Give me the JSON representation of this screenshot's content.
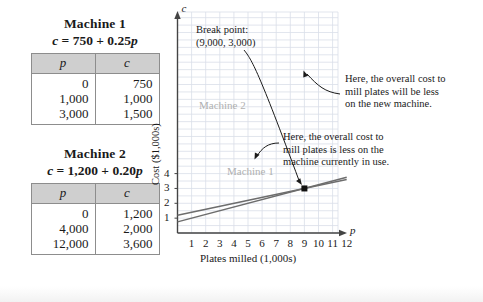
{
  "tables": [
    {
      "name": "machine-1",
      "title": "Machine 1",
      "formula_prefix": "c",
      "formula_body": " = 750 + 0.25",
      "formula_var": "p",
      "headers": [
        "p",
        "c"
      ],
      "rows": [
        [
          "0",
          "750"
        ],
        [
          "1,000",
          "1,000"
        ],
        [
          "3,000",
          "1,500"
        ]
      ]
    },
    {
      "name": "machine-2",
      "title": "Machine 2",
      "formula_prefix": "c",
      "formula_body": " = 1,200 + 0.20",
      "formula_var": "p",
      "headers": [
        "p",
        "c"
      ],
      "rows": [
        [
          "0",
          "1,200"
        ],
        [
          "4,000",
          "2,000"
        ],
        [
          "12,000",
          "3,600"
        ]
      ]
    }
  ],
  "chart_data": {
    "type": "line",
    "title": "",
    "xlabel": "Plates milled (1,000s)",
    "ylabel": "Cost ($1,000s)",
    "x_axis_symbol": "p",
    "y_axis_symbol": "c",
    "xlim": [
      0,
      12
    ],
    "ylim": [
      0,
      4.2
    ],
    "xticks": [
      "1",
      "2",
      "3",
      "4",
      "5",
      "6",
      "7",
      "8",
      "9",
      "10",
      "11",
      "12"
    ],
    "xtick_values": [
      1,
      2,
      3,
      4,
      5,
      6,
      7,
      8,
      9,
      10,
      11,
      12
    ],
    "yticks": [
      "1",
      "2",
      "3",
      "4"
    ],
    "ytick_values": [
      1,
      2,
      3,
      4
    ],
    "grid": true,
    "grid_color": "#d9dee8",
    "legend_position": "inline",
    "series": [
      {
        "name": "Machine 1",
        "label": "Machine 1",
        "equation": "c = 750 + 0.25p",
        "intercept": 0.75,
        "slope": 0.25,
        "color": "#6d6d6d",
        "points": [
          [
            0,
            0.75
          ],
          [
            12,
            3.75
          ]
        ]
      },
      {
        "name": "Machine 2",
        "label": "Machine 2",
        "equation": "c = 1,200 + 0.20p",
        "intercept": 1.2,
        "slope": 0.2,
        "color": "#6d6d6d",
        "points": [
          [
            0,
            1.2
          ],
          [
            12,
            3.6
          ]
        ]
      }
    ],
    "annotations": [
      {
        "name": "break-point",
        "line1": "Break point:",
        "line2": "(9,000, 3,000)",
        "point_x": 9,
        "point_y": 3
      },
      {
        "name": "new-machine-note",
        "line1": "Here, the overall cost to",
        "line2": "mill plates will be less",
        "line3": "on the new machine."
      },
      {
        "name": "current-machine-note",
        "line1": "Here, the overall cost to",
        "line2": "mill plates is less on the",
        "line3": "machine currently in use."
      }
    ]
  }
}
